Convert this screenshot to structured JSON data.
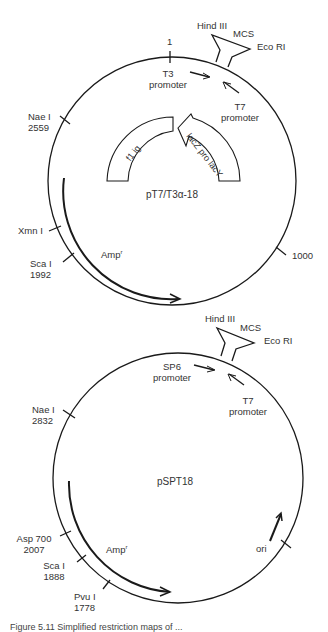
{
  "plasmid1": {
    "name": "pT7/T3α-18",
    "position_one": "1",
    "mcs": {
      "label": "MCS",
      "left_site": "Hind III",
      "right_site": "Eco RI"
    },
    "promoters": [
      {
        "name": "T3",
        "sub": "promoter"
      },
      {
        "name": "T7",
        "sub": "promoter"
      }
    ],
    "sites": [
      {
        "name": "Nae I",
        "position": "2559"
      },
      {
        "name": "Xmn I",
        "position": ""
      },
      {
        "name": "Sca I",
        "position": "1992"
      },
      {
        "name": "",
        "position": "1000"
      }
    ],
    "inner_genes": [
      {
        "label": "f1 ig"
      },
      {
        "label": "lacZ pro lacY"
      }
    ],
    "resistance": {
      "label": "Amp",
      "sup": "r"
    }
  },
  "plasmid2": {
    "name": "pSPT18",
    "mcs": {
      "label": "MCS",
      "left_site": "Hind III",
      "right_site": "Eco RI"
    },
    "promoters": [
      {
        "name": "SP6",
        "sub": "promoter"
      },
      {
        "name": "T7",
        "sub": "promoter"
      }
    ],
    "sites": [
      {
        "name": "Nae I",
        "position": "2832"
      },
      {
        "name": "Asp 700",
        "position": "2007"
      },
      {
        "name": "Sca I",
        "position": "1888"
      },
      {
        "name": "Pvu I",
        "position": "1778"
      }
    ],
    "resistance": {
      "label": "Amp",
      "sup": "r"
    },
    "origin": {
      "label": "ori"
    }
  },
  "caption": "Figure 5.11  Simplified restriction maps of ..."
}
